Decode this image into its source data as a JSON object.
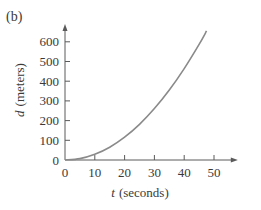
{
  "panel_label": "(b)",
  "chart_data": {
    "type": "line",
    "title": "",
    "xlabel_var": "t",
    "xlabel_unit": "(seconds)",
    "ylabel_var": "d",
    "ylabel_unit": "(meters)",
    "xlim": [
      0,
      58
    ],
    "ylim": [
      0,
      690
    ],
    "xticks": [
      0,
      10,
      20,
      30,
      40,
      50
    ],
    "yticks": [
      0,
      100,
      200,
      300,
      400,
      500,
      600
    ],
    "grid": false,
    "legend": "none",
    "colors": {
      "axis": "#5a5a5a",
      "curve": "#8a8a8a",
      "text": "#3a3a3a"
    },
    "series": [
      {
        "name": "d(t)",
        "x": [
          0,
          5,
          10,
          15,
          20,
          25,
          30,
          35,
          40,
          45,
          47.5
        ],
        "y": [
          0,
          7,
          29,
          65,
          116,
          181,
          261,
          355,
          464,
          587,
          655
        ]
      }
    ]
  }
}
